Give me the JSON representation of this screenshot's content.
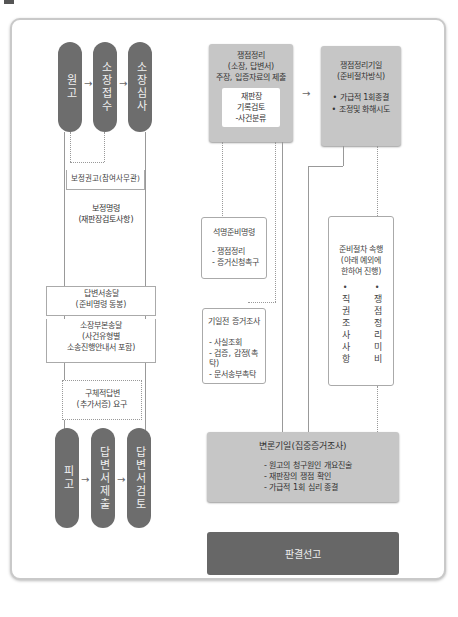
{
  "left": {
    "top_pillars": [
      {
        "label": "원고"
      },
      {
        "label": "소장접수"
      },
      {
        "label": "소장심사"
      }
    ],
    "steps": {
      "correction_recommend": "보정권고(참여사무관)",
      "correction_order_1": "보정명령",
      "correction_order_2": "(재판장검토사항)",
      "answer_delivery_1": "답변서송달",
      "answer_delivery_2": "(준비명령 동봉)",
      "complaint_delivery_1": "소장부본송달",
      "complaint_delivery_2": "(사건유형별",
      "complaint_delivery_3": "소송진행안내서 포함)",
      "specific_answer_1": "구체적답변",
      "specific_answer_2": "(추가서증) 요구"
    },
    "bottom_pillars": [
      {
        "label": "피고"
      },
      {
        "label": "답변서제출"
      },
      {
        "label": "답변서검토"
      }
    ]
  },
  "right": {
    "issue_box": {
      "line1": "쟁점정리",
      "line2": "(소장, 답변서)",
      "line3": "주장, 입증자료의 제출",
      "inner1": "재판장",
      "inner2": "기록검토",
      "inner3": "-사건분류"
    },
    "hearing_date_box": {
      "line1": "쟁점정리기일",
      "line2": "(준비절차방식)",
      "bullet1": "• 가급적 1회종결",
      "bullet2": "• 조정및 화해시도"
    },
    "written_prep_box": {
      "title": "석명준비명령",
      "item1": "- 쟁점정리",
      "item2": "- 증거신청촉구"
    },
    "pre_hearing_box": {
      "title": "기일전 증거조사",
      "item1": "- 사실조회",
      "item2": "- 검증, 감정(촉탁)",
      "item3": "- 문서송부촉탁"
    },
    "prep_procedure_box": {
      "line1": "준비절차 속행",
      "line2": "(아래 예외에",
      "line3": "한하여 진행)",
      "col1_bullet": "•",
      "col1": "직권조사사항",
      "col2_bullet": "•",
      "col2": "쟁점정리미비"
    },
    "argument_box": {
      "title": "변론기일(집중증거조사)",
      "item1": "- 원고의 청구원인 개요진술",
      "item2": "- 재판장의 쟁점 확인",
      "item3": "- 가급적 1회 심리 종결"
    },
    "verdict": {
      "label": "판결선고"
    }
  },
  "arrows": {
    "right": "→"
  },
  "colors": {
    "pill": "#6d6d6d",
    "grey_box": "#c6c6c6",
    "verdict": "#676767",
    "frame": "#c9c9c9"
  }
}
